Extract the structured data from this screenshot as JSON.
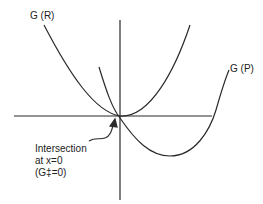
{
  "diagram": {
    "type": "free-energy-parabolas",
    "labels": {
      "reactant_curve": "G (R)",
      "product_curve": "G (P)",
      "annotation_line1": "Intersection",
      "annotation_line2": "at x=0",
      "annotation_line3": "(G‡=0)"
    },
    "colors": {
      "stroke": "#2a2a2a",
      "text": "#222222",
      "background": "#ffffff"
    },
    "elements": {
      "x_axis": "horizontal axis",
      "y_axis": "vertical axis",
      "curves": [
        "G (R)",
        "G (P)"
      ],
      "arrow": "points to intersection at origin"
    }
  }
}
